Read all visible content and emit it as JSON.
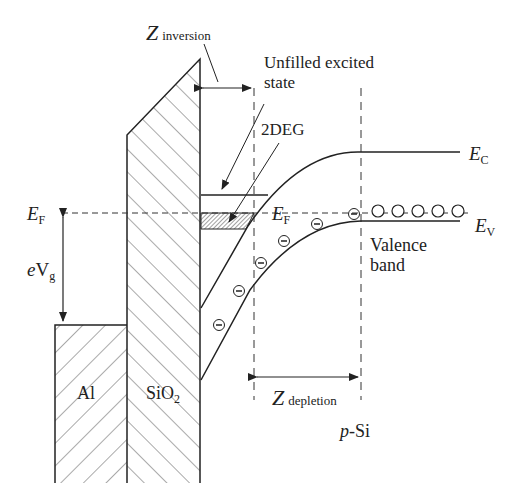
{
  "diagram": {
    "type": "band-diagram",
    "labels": {
      "z_inversion": "Z",
      "z_inversion_sub": "inversion",
      "unfilled_line1": "Unfilled excited",
      "unfilled_line2": "state",
      "twodeg": "2DEG",
      "ec": "E",
      "ec_sub": "C",
      "ev": "E",
      "ev_sub": "V",
      "ef_left": "E",
      "ef_left_sub": "F",
      "ef_mid": "E",
      "ef_mid_sub": "F",
      "evg_e": "e",
      "evg_v": "V",
      "evg_sub": "g",
      "valence_line1": "Valence",
      "valence_line2": "band",
      "al": "Al",
      "sio2": "SiO",
      "sio2_sub": "2",
      "z_depletion": "Z",
      "z_depletion_sub": "depletion",
      "psi_p": "p",
      "psi_si": "-Si"
    },
    "regions": [
      "Al",
      "SiO2",
      "p-Si"
    ],
    "symbols": {
      "electron": "⊖",
      "hole": "○"
    },
    "counts": {
      "electrons_in_band": 7,
      "holes_on_ev": 5
    },
    "colors": {
      "line": "#222222",
      "hatch": "#555555",
      "background": "#ffffff"
    }
  }
}
